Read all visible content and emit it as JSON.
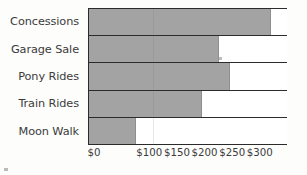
{
  "chart_data": {
    "type": "bar",
    "orientation": "horizontal",
    "title": "",
    "xlabel": "",
    "ylabel": "",
    "categories": [
      "Concessions",
      "Garage Sale",
      "Pony Rides",
      "Train Rides",
      "Moon Walk"
    ],
    "values": [
      330,
      235,
      255,
      205,
      85
    ],
    "xlim": [
      0,
      360
    ],
    "xticks": [
      0,
      100,
      150,
      200,
      250,
      300
    ],
    "xtick_labels": [
      "$0",
      "$100",
      "$150",
      "$200",
      "$250",
      "$300"
    ],
    "grid": false,
    "legend": null,
    "bar_color": "#a3a3a3",
    "axis_color": "#2b2b2b",
    "background_color": "#ffffff"
  }
}
